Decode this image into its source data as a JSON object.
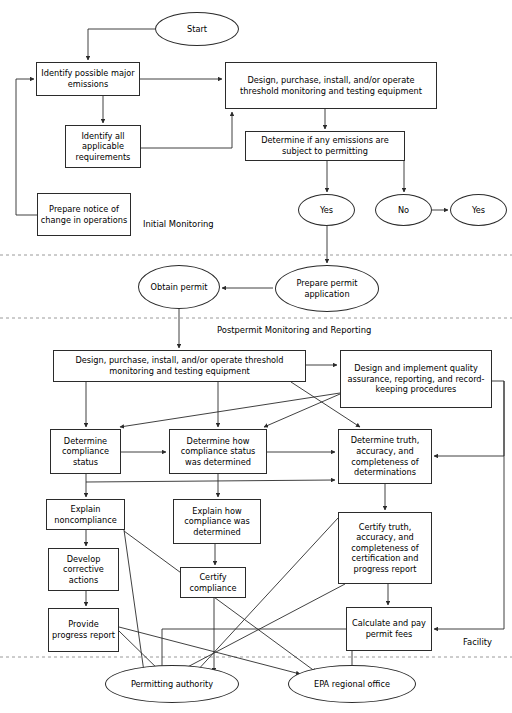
{
  "diagram": {
    "width": 512,
    "height": 713,
    "line_color": "#2b2b2b",
    "divider_color": "#9a9a9a",
    "background": "#ffffff"
  },
  "section_labels": [
    {
      "id": "initial-monitoring",
      "text": "Initial Monitoring",
      "x": 141,
      "y": 219
    },
    {
      "id": "postpermit",
      "text": "Postpermit Monitoring and Reporting",
      "x": 215,
      "y": 325
    },
    {
      "id": "facility",
      "text": "Facility",
      "x": 461,
      "y": 637
    }
  ],
  "dividers": [
    {
      "id": "divider-initial-permit",
      "y": 255
    },
    {
      "id": "divider-permit-postpermit",
      "y": 318
    },
    {
      "id": "divider-facility-external",
      "y": 657
    }
  ],
  "nodes": [
    {
      "id": "start",
      "shape": "ellipse",
      "text": "Start",
      "x": 155,
      "y": 12,
      "w": 84,
      "h": 34
    },
    {
      "id": "identify-possible-major-emissions",
      "shape": "box",
      "text": "Identify possible major emissions",
      "x": 36,
      "y": 62,
      "w": 104,
      "h": 34
    },
    {
      "id": "design-purchase-install-operate-top",
      "shape": "box",
      "text": "Design, purchase, install, and/or operate threshold monitoring and testing equipment",
      "x": 225,
      "y": 62,
      "w": 212,
      "h": 47
    },
    {
      "id": "identify-all-applicable-requirements",
      "shape": "box",
      "text": "Identify all applicable requirements",
      "x": 65,
      "y": 125,
      "w": 76,
      "h": 43
    },
    {
      "id": "determine-if-emissions-subject-permitting",
      "shape": "box",
      "text": "Determine if any emissions are subject to permitting",
      "x": 245,
      "y": 131,
      "w": 160,
      "h": 30
    },
    {
      "id": "prepare-notice-of-change",
      "shape": "box",
      "text": "Prepare notice of change in operations",
      "x": 37,
      "y": 193,
      "w": 94,
      "h": 43
    },
    {
      "id": "yes-permitting",
      "shape": "ellipse",
      "text": "Yes",
      "x": 298,
      "y": 194,
      "w": 57,
      "h": 32
    },
    {
      "id": "no-permitting",
      "shape": "ellipse",
      "text": "No",
      "x": 375,
      "y": 194,
      "w": 57,
      "h": 32
    },
    {
      "id": "yes-right",
      "shape": "ellipse",
      "text": "Yes",
      "x": 450,
      "y": 194,
      "w": 57,
      "h": 32
    },
    {
      "id": "prepare-permit-application",
      "shape": "ellipse",
      "text": "Prepare permit application",
      "x": 275,
      "y": 265,
      "w": 104,
      "h": 47
    },
    {
      "id": "obtain-permit",
      "shape": "ellipse",
      "text": "Obtain permit",
      "x": 138,
      "y": 265,
      "w": 82,
      "h": 44
    },
    {
      "id": "design-purchase-install-operate-bottom",
      "shape": "box",
      "text": "Design, purchase, install, and/or operate threshold monitoring and testing equipment",
      "x": 53,
      "y": 350,
      "w": 253,
      "h": 32
    },
    {
      "id": "design-implement-quality-assurance",
      "shape": "box",
      "text": "Design and implement quality assurance, reporting, and record-keeping procedures",
      "x": 340,
      "y": 350,
      "w": 152,
      "h": 58
    },
    {
      "id": "determine-compliance-status",
      "shape": "box",
      "text": "Determine compliance status",
      "x": 50,
      "y": 429,
      "w": 71,
      "h": 45
    },
    {
      "id": "determine-how-compliance-status-determined",
      "shape": "box",
      "text": "Determine how compliance status was determined",
      "x": 169,
      "y": 429,
      "w": 98,
      "h": 45
    },
    {
      "id": "determine-truth-accuracy-completeness",
      "shape": "box",
      "text": "Determine truth, accuracy, and completeness of determinations",
      "x": 338,
      "y": 429,
      "w": 94,
      "h": 55
    },
    {
      "id": "explain-noncompliance",
      "shape": "box",
      "text": "Explain noncompliance",
      "x": 46,
      "y": 499,
      "w": 79,
      "h": 31
    },
    {
      "id": "explain-how-compliance-determined",
      "shape": "box",
      "text": "Explain how compliance was determined",
      "x": 173,
      "y": 499,
      "w": 88,
      "h": 45
    },
    {
      "id": "certify-truth-accuracy-completeness",
      "shape": "box",
      "text": "Certify truth, accuracy, and completeness of certification and progress report",
      "x": 338,
      "y": 512,
      "w": 94,
      "h": 72
    },
    {
      "id": "develop-corrective-actions",
      "shape": "box",
      "text": "Develop corrective actions",
      "x": 48,
      "y": 548,
      "w": 71,
      "h": 43
    },
    {
      "id": "certify-compliance",
      "shape": "box",
      "text": "Certify compliance",
      "x": 180,
      "y": 567,
      "w": 66,
      "h": 31
    },
    {
      "id": "provide-progress-report",
      "shape": "box",
      "text": "Provide progress report",
      "x": 48,
      "y": 608,
      "w": 71,
      "h": 44
    },
    {
      "id": "calculate-pay-permit-fees",
      "shape": "box",
      "text": "Calculate and pay permit fees",
      "x": 346,
      "y": 607,
      "w": 86,
      "h": 44
    },
    {
      "id": "permitting-authority",
      "shape": "ellipse",
      "text": "Permitting authority",
      "x": 105,
      "y": 665,
      "w": 134,
      "h": 38
    },
    {
      "id": "epa-regional-office",
      "shape": "ellipse",
      "text": "EPA regional office",
      "x": 288,
      "y": 665,
      "w": 128,
      "h": 38
    }
  ],
  "edges": [
    {
      "id": "edge-start-to-identify",
      "from": "start",
      "to": "identify-possible-major-emissions",
      "path": "M 155 29 L 88 29 L 88 60"
    },
    {
      "id": "edge-identify-to-design-top",
      "from": "identify-possible-major-emissions",
      "to": "design-purchase-install-operate-top",
      "path": "M 140 79 L 222 79"
    },
    {
      "id": "edge-identify-to-requirements",
      "from": "identify-possible-major-emissions",
      "to": "identify-all-applicable-requirements",
      "path": "M 103 96 L 103 123"
    },
    {
      "id": "edge-requirements-to-design-top",
      "from": "identify-all-applicable-requirements",
      "to": "design-purchase-install-operate-top",
      "path": "M 141 148 L 232 148 L 232 112"
    },
    {
      "id": "edge-design-top-to-determine",
      "from": "design-purchase-install-operate-top",
      "to": "determine-if-emissions-subject-permitting",
      "path": "M 325 109 L 325 129"
    },
    {
      "id": "edge-determine-to-yes",
      "from": "determine-if-emissions-subject-permitting",
      "to": "yes-permitting",
      "path": "M 327 161 L 327 192"
    },
    {
      "id": "edge-determine-to-no",
      "from": "determine-if-emissions-subject-permitting",
      "to": "no-permitting",
      "path": "M 404 161 L 404 192"
    },
    {
      "id": "edge-no-to-yes-right",
      "from": "no-permitting",
      "to": "yes-right",
      "path": "M 432 210 L 448 210"
    },
    {
      "id": "edge-notice-to-identify",
      "from": "prepare-notice-of-change",
      "to": "identify-possible-major-emissions",
      "path": "M 37 215 L 16 215 L 16 79 L 34 79"
    },
    {
      "id": "edge-yes-to-prepare-permit",
      "from": "yes-permitting",
      "to": "prepare-permit-application",
      "path": "M 327 226 L 327 263"
    },
    {
      "id": "edge-prepare-permit-to-obtain",
      "from": "prepare-permit-application",
      "to": "obtain-permit",
      "path": "M 273 288 L 222 288"
    },
    {
      "id": "edge-obtain-to-design-bottom",
      "from": "obtain-permit",
      "to": "design-purchase-install-operate-bottom",
      "path": "M 179 309 L 179 348"
    },
    {
      "id": "edge-design-bottom-to-quality",
      "from": "design-purchase-install-operate-bottom",
      "to": "design-implement-quality-assurance",
      "path": "M 306 365 L 337 365"
    },
    {
      "id": "edge-design-bottom-to-compliance-status",
      "from": "design-purchase-install-operate-bottom",
      "to": "determine-compliance-status",
      "path": "M 86 382 L 86 427"
    },
    {
      "id": "edge-design-bottom-to-how-determined",
      "from": "design-purchase-install-operate-bottom",
      "to": "determine-how-compliance-status-determined",
      "path": "M 218 382 L 218 427"
    },
    {
      "id": "edge-design-bottom-to-truth",
      "from": "design-purchase-install-operate-bottom",
      "to": "determine-truth-accuracy-completeness",
      "path": "M 291 382 L 360 427"
    },
    {
      "id": "edge-quality-to-compliance-status",
      "from": "design-implement-quality-assurance",
      "to": "determine-compliance-status",
      "path": "M 340 393 L 120 427"
    },
    {
      "id": "edge-quality-to-how-determined",
      "from": "design-implement-quality-assurance",
      "to": "determine-how-compliance-status-determined",
      "path": "M 340 394 L 264 427"
    },
    {
      "id": "edge-quality-to-truth-right",
      "from": "design-implement-quality-assurance",
      "to": "determine-truth-accuracy-completeness",
      "path": "M 492 381 L 504 381 L 504 456 L 434 456"
    },
    {
      "id": "edge-compliance-status-to-how-determined",
      "from": "determine-compliance-status",
      "to": "determine-how-compliance-status-determined",
      "path": "M 121 452 L 166 452"
    },
    {
      "id": "edge-how-determined-to-truth",
      "from": "determine-how-compliance-status-determined",
      "to": "determine-truth-accuracy-completeness",
      "path": "M 267 452 L 335 452"
    },
    {
      "id": "edge-compliance-status-to-truth-lower",
      "from": "determine-compliance-status",
      "to": "determine-truth-accuracy-completeness",
      "path": "M 86 482 L 335 480"
    },
    {
      "id": "edge-compliance-status-to-explain-noncompliance",
      "from": "determine-compliance-status",
      "to": "explain-noncompliance",
      "path": "M 86 474 L 86 497"
    },
    {
      "id": "edge-how-determined-to-explain-how",
      "from": "determine-how-compliance-status-determined",
      "to": "explain-how-compliance-determined",
      "path": "M 218 474 L 218 497"
    },
    {
      "id": "edge-truth-to-certify-truth",
      "from": "determine-truth-accuracy-completeness",
      "to": "certify-truth-accuracy-completeness",
      "path": "M 385 484 L 385 510"
    },
    {
      "id": "edge-explain-noncompliance-to-develop",
      "from": "explain-noncompliance",
      "to": "develop-corrective-actions",
      "path": "M 86 530 L 86 546"
    },
    {
      "id": "edge-explain-how-to-certify-compliance",
      "from": "explain-how-compliance-determined",
      "to": "certify-compliance",
      "path": "M 215 544 L 215 565"
    },
    {
      "id": "edge-develop-to-provide-progress",
      "from": "develop-corrective-actions",
      "to": "provide-progress-report",
      "path": "M 86 591 L 86 606"
    },
    {
      "id": "edge-certify-truth-to-calculate-fees",
      "from": "certify-truth-accuracy-completeness",
      "to": "calculate-pay-permit-fees",
      "path": "M 388 584 L 388 605"
    },
    {
      "id": "edge-facility-to-calculate-fees",
      "from": "design-implement-quality-assurance",
      "to": "calculate-pay-permit-fees",
      "path": "M 504 381 L 504 629 L 434 629"
    },
    {
      "id": "edge-provide-progress-to-permitting",
      "from": "provide-progress-report",
      "to": "permitting-authority",
      "path": "M 119 631 L 163 674"
    },
    {
      "id": "edge-explain-noncompliance-to-permitting",
      "from": "explain-noncompliance",
      "to": "permitting-authority",
      "path": "M 124 530 L 144 672"
    },
    {
      "id": "edge-certify-compliance-down-permitting",
      "from": "certify-compliance",
      "to": "permitting-authority",
      "path": "M 214 598 L 214 672"
    },
    {
      "id": "edge-explain-noncompliance-to-epa",
      "from": "explain-noncompliance",
      "to": "epa-regional-office",
      "path": "M 124 531 L 316 672"
    },
    {
      "id": "edge-certify-truth-to-permitting",
      "from": "certify-truth-accuracy-completeness",
      "to": "permitting-authority",
      "path": "M 338 518 L 195 673"
    },
    {
      "id": "edge-provide-progress-to-epa",
      "from": "provide-progress-report",
      "to": "epa-regional-office",
      "path": "M 119 627 L 300 674"
    },
    {
      "id": "edge-calculate-fees-down-epa",
      "from": "calculate-pay-permit-fees",
      "to": "epa-regional-office",
      "path": "M 352 651 L 352 672"
    },
    {
      "id": "edge-fees-left-to-permitting",
      "from": "calculate-pay-permit-fees",
      "to": "permitting-authority",
      "path": "M 346 629 L 162 629 L 162 672"
    },
    {
      "id": "edge-certify-truth-left-to-permitting",
      "from": "certify-truth-accuracy-completeness",
      "to": "permitting-authority",
      "path": "M 345 584 L 178 672"
    }
  ]
}
